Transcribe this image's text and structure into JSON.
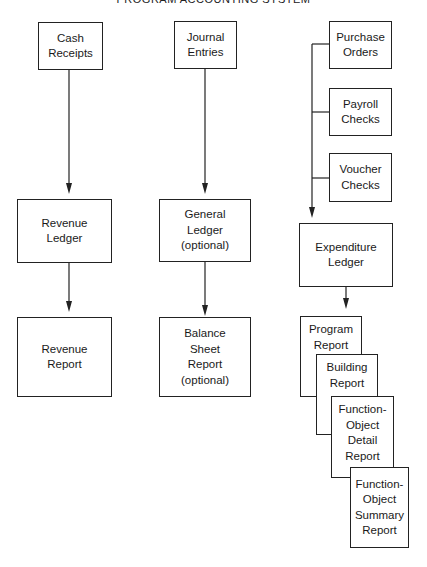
{
  "title": "PROGRAM ACCOUNTING SYSTEM",
  "columns": {
    "revenue": {
      "source": {
        "lines": [
          "Cash",
          "Receipts"
        ]
      },
      "ledger": {
        "lines": [
          "Revenue",
          "Ledger"
        ]
      },
      "report": {
        "lines": [
          "Revenue",
          "Report"
        ]
      }
    },
    "general": {
      "source": {
        "lines": [
          "Journal",
          "Entries"
        ]
      },
      "ledger": {
        "lines": [
          "General",
          "Ledger",
          "(optional)"
        ]
      },
      "report": {
        "lines": [
          "Balance",
          "Sheet",
          "Report",
          "(optional)"
        ]
      }
    },
    "expenditure": {
      "sources": [
        {
          "lines": [
            "Purchase",
            "Orders"
          ]
        },
        {
          "lines": [
            "Payroll",
            "Checks"
          ]
        },
        {
          "lines": [
            "Voucher",
            "Checks"
          ]
        }
      ],
      "ledger": {
        "lines": [
          "Expenditure",
          "Ledger"
        ]
      },
      "reports": [
        {
          "lines": [
            "Program",
            "Report"
          ]
        },
        {
          "lines": [
            "Building",
            "Report"
          ]
        },
        {
          "lines": [
            "Function-",
            "Object",
            "Detail",
            "Report"
          ]
        },
        {
          "lines": [
            "Function-",
            "Object",
            "Summary",
            "Report"
          ]
        }
      ]
    }
  },
  "colors": {
    "line": "#222222",
    "background": "#ffffff"
  }
}
